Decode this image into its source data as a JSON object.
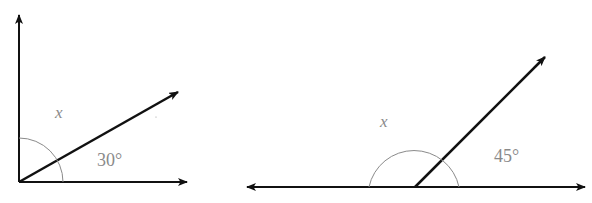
{
  "figures": [
    {
      "name": "figure-1",
      "vertex": [
        19,
        182
      ],
      "unknown_label": "x",
      "given_label": "30°",
      "given_angle_deg": 30,
      "arc_radius": 44
    },
    {
      "name": "figure-2",
      "vertex": [
        415,
        187
      ],
      "unknown_label": "x",
      "given_label": "45°",
      "given_angle_deg": 45,
      "arc_radius": 45
    }
  ],
  "colors": {
    "line": "#111111",
    "arc": "#8a8a8a",
    "label": "#8a8a8a"
  }
}
